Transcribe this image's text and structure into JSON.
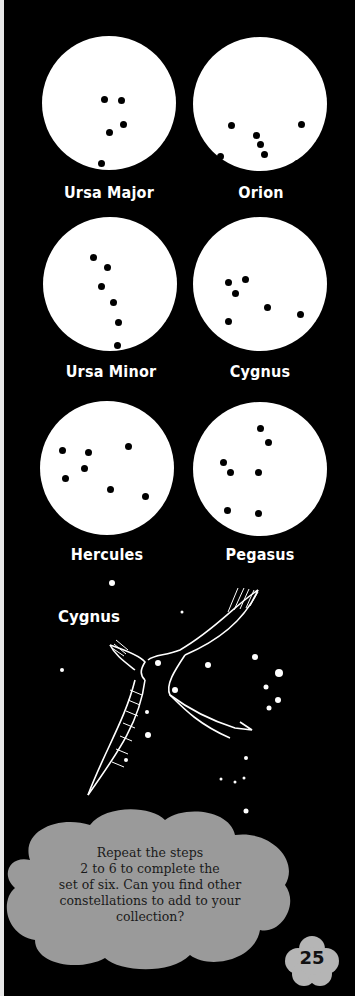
{
  "constellations": [
    {
      "name": "Ursa Major",
      "dots": [
        [
          62,
          63
        ],
        [
          79,
          64
        ],
        [
          67,
          96
        ],
        [
          81,
          88
        ],
        [
          59,
          127
        ],
        [
          64,
          150
        ]
      ]
    },
    {
      "name": "Orion",
      "dots": [
        [
          38,
          88
        ],
        [
          108,
          87
        ],
        [
          63,
          98
        ],
        [
          67,
          107
        ],
        [
          71,
          117
        ],
        [
          27,
          119
        ],
        [
          104,
          126
        ]
      ]
    },
    {
      "name": "Ursa Minor",
      "dots": [
        [
          50,
          40
        ],
        [
          64,
          50
        ],
        [
          58,
          69
        ],
        [
          70,
          85
        ],
        [
          75,
          105
        ],
        [
          74,
          128
        ],
        [
          65,
          146
        ]
      ]
    },
    {
      "name": "Cygnus",
      "dots": [
        [
          52,
          62
        ],
        [
          35,
          65
        ],
        [
          42,
          76
        ],
        [
          74,
          90
        ],
        [
          107,
          97
        ],
        [
          35,
          104
        ]
      ]
    },
    {
      "name": "Hercules",
      "dots": [
        [
          22,
          49
        ],
        [
          48,
          51
        ],
        [
          88,
          45
        ],
        [
          44,
          67
        ],
        [
          25,
          77
        ],
        [
          70,
          88
        ],
        [
          105,
          95
        ]
      ]
    },
    {
      "name": "Pegasus",
      "dots": [
        [
          67,
          26
        ],
        [
          75,
          40
        ],
        [
          30,
          60
        ],
        [
          37,
          70
        ],
        [
          65,
          70
        ],
        [
          34,
          108
        ],
        [
          65,
          111
        ]
      ]
    }
  ],
  "illustration": {
    "title": "Cygnus"
  },
  "instruction": {
    "text": "Repeat the steps 2 to 6 to complete the set of six. Can you find other constellations to add to your collection?",
    "lines": [
      "Repeat the steps",
      "2 to 6 to complete the",
      "set of six. Can you find other",
      "constellations to add to your",
      "collection?"
    ]
  },
  "page_number": "25",
  "colors": {
    "background": "#000000",
    "disc": "#ffffff",
    "cloud": "#999999"
  }
}
